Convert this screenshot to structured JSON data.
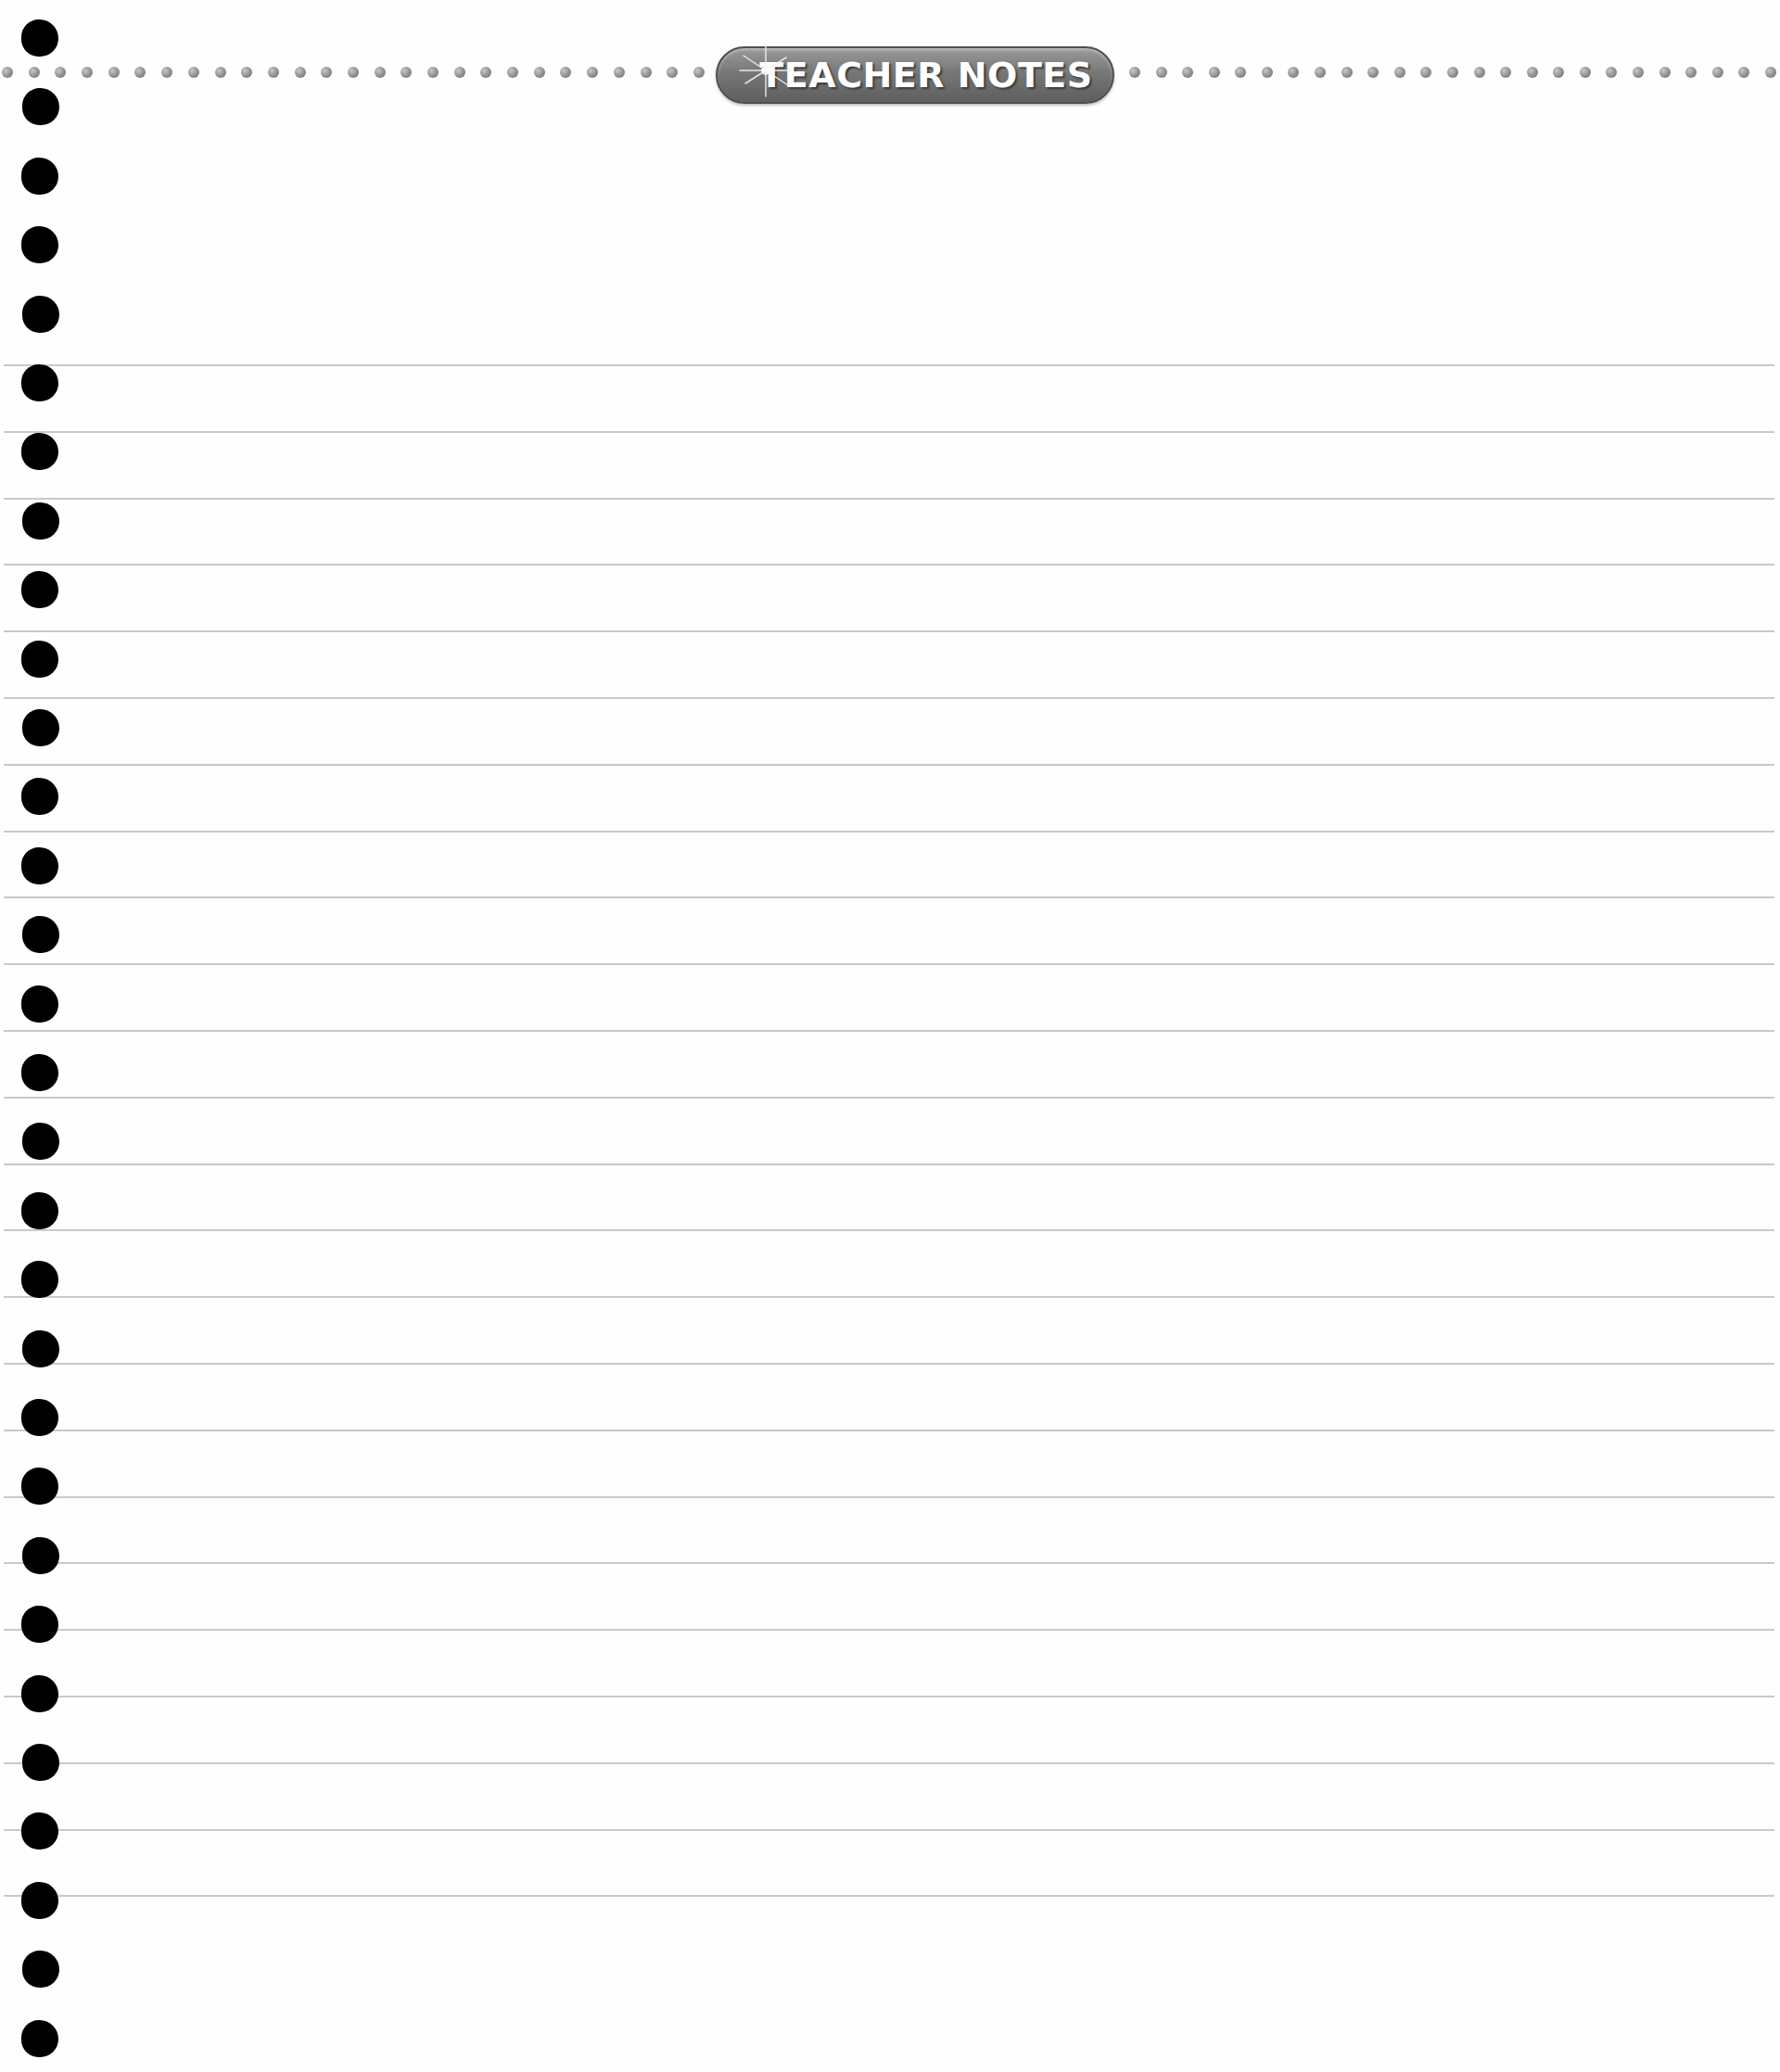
{
  "header": {
    "title": "TEACHER NOTES",
    "icon": "sparkle-icon"
  },
  "page": {
    "ruled_line_count": 24,
    "binder_hole_count": 30,
    "colors": {
      "background": "#fefefe",
      "rule_line": "#c9c9c9",
      "banner_fill": "#777777",
      "banner_text": "#ffffff",
      "hole": "#000000",
      "dot": "#8e8e8e"
    }
  }
}
